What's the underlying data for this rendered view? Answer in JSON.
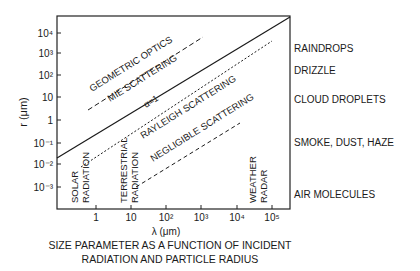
{
  "diagram": {
    "y_axis": {
      "label": "r (μm)",
      "ticks": [
        "10⁴",
        "10³",
        "10²",
        "10",
        "1",
        "10⁻¹",
        "10⁻²",
        "10⁻³"
      ]
    },
    "x_axis": {
      "label": "λ (μm)",
      "ticks": [
        "1",
        "10",
        "10²",
        "10³",
        "10⁴",
        "10⁵"
      ]
    },
    "regions": {
      "geometric_optics": "GEOMETRIC OPTICS",
      "mie_scattering": "MIE SCATTERING",
      "alpha_line": "α=1",
      "rayleigh_scattering": "RAYLEIGH SCATTERING",
      "negligible_scattering": "NEGLIGIBLE SCATTERING"
    },
    "radiation_labels": {
      "solar": [
        "SOLAR",
        "RADIATION"
      ],
      "terrestrial": [
        "TERRESTRIAL",
        "RADIATION"
      ],
      "weather_radar": [
        "WEATHER",
        "RADAR"
      ]
    },
    "particle_labels": [
      "RAINDROPS",
      "DRIZZLE",
      "CLOUD DROPLETS",
      "SMOKE, DUST, HAZE",
      "AIR MOLECULES"
    ],
    "caption": [
      "SIZE PARAMETER AS A FUNCTION OF INCIDENT",
      "RADIATION AND PARTICLE RADIUS"
    ]
  }
}
